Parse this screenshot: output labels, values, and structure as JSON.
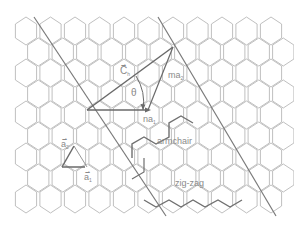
{
  "diagram": {
    "colors": {
      "lattice": "#b4b4b4",
      "bold_edges": "#6e6e6e",
      "lines": "#7a7a7a",
      "vectors": "#6a6a6a",
      "label": "#8a8a8a"
    },
    "labels": {
      "chiral_vector": "C",
      "chiral_vector_sub": "h",
      "theta": "θ",
      "ma": "ma",
      "ma_sub": "2",
      "na": "na",
      "na_sub": "1",
      "a2": "a",
      "a2_sub": "2",
      "a1": "a",
      "a1_sub": "1",
      "armchair": "armchair",
      "zigzag": "zig-zag"
    },
    "lattice": {
      "hex_radius": 14,
      "col_spacing": 24.5,
      "row_spacing": 21,
      "origin_x": 26,
      "origin_y": 31,
      "rows": 10,
      "cols": 12
    }
  }
}
